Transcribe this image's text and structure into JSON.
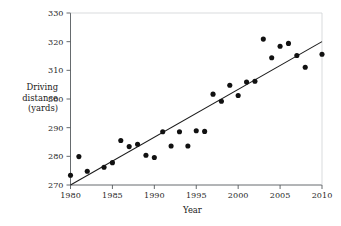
{
  "chart_data": {
    "type": "scatter",
    "title": "",
    "xlabel": "Year",
    "ylabel": "Driving distance (yards)",
    "ylabel_lines": [
      "Driving",
      "distance",
      "(yards)"
    ],
    "xlim": [
      1980,
      2010
    ],
    "ylim": [
      270,
      330
    ],
    "xticks": [
      1980,
      1985,
      1990,
      1995,
      2000,
      2005,
      2010
    ],
    "yticks": [
      270,
      280,
      290,
      300,
      310,
      320,
      330
    ],
    "grid": false,
    "legend": null,
    "point_color": "#111111",
    "line_color": "#1a1a1a",
    "axis_color": "#555a5e",
    "x": [
      1980,
      1981,
      1982,
      1984,
      1985,
      1986,
      1987,
      1988,
      1989,
      1990,
      1991,
      1992,
      1993,
      1994,
      1995,
      1996,
      1997,
      1998,
      1999,
      2000,
      2001,
      2002,
      2003,
      2004,
      2005,
      2006,
      2007,
      2008,
      2010
    ],
    "y": [
      273.4,
      279.9,
      274.8,
      276.2,
      277.8,
      285.5,
      283.4,
      284.2,
      280.4,
      279.6,
      288.6,
      283.6,
      288.6,
      283.6,
      288.9,
      288.7,
      301.7,
      299.2,
      304.8,
      301.2,
      305.9,
      306.2,
      320.9,
      314.4,
      318.4,
      319.4,
      315.2,
      311.1,
      315.6
    ],
    "series": [
      {
        "name": "Driving distance",
        "points": [
          {
            "x": 1980,
            "y": 273.4
          },
          {
            "x": 1981,
            "y": 279.9
          },
          {
            "x": 1982,
            "y": 274.8
          },
          {
            "x": 1984,
            "y": 276.2
          },
          {
            "x": 1985,
            "y": 277.8
          },
          {
            "x": 1986,
            "y": 285.5
          },
          {
            "x": 1987,
            "y": 283.4
          },
          {
            "x": 1988,
            "y": 284.2
          },
          {
            "x": 1989,
            "y": 280.4
          },
          {
            "x": 1990,
            "y": 279.6
          },
          {
            "x": 1991,
            "y": 288.6
          },
          {
            "x": 1992,
            "y": 283.6
          },
          {
            "x": 1993,
            "y": 288.6
          },
          {
            "x": 1994,
            "y": 283.6
          },
          {
            "x": 1995,
            "y": 288.9
          },
          {
            "x": 1996,
            "y": 288.7
          },
          {
            "x": 1997,
            "y": 301.7
          },
          {
            "x": 1998,
            "y": 299.2
          },
          {
            "x": 1999,
            "y": 304.8
          },
          {
            "x": 2000,
            "y": 301.2
          },
          {
            "x": 2001,
            "y": 305.9
          },
          {
            "x": 2002,
            "y": 306.2
          },
          {
            "x": 2003,
            "y": 320.9
          },
          {
            "x": 2004,
            "y": 314.4
          },
          {
            "x": 2005,
            "y": 318.4
          },
          {
            "x": 2006,
            "y": 319.4
          },
          {
            "x": 2007,
            "y": 315.2
          },
          {
            "x": 2008,
            "y": 311.1
          },
          {
            "x": 2010,
            "y": 315.6
          }
        ]
      }
    ],
    "trendline": {
      "type": "linear",
      "x_start": 1980,
      "y_start": 270.0,
      "x_end": 2010,
      "y_end": 320.0
    }
  }
}
